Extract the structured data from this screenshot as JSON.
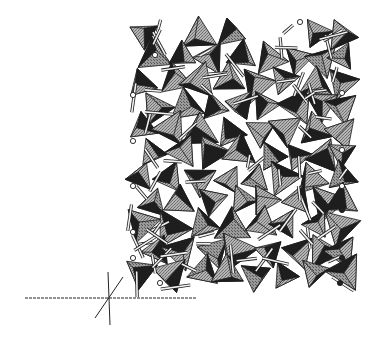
{
  "figure": {
    "type": "crystal-structure-polyhedral-model",
    "width": 376,
    "height": 341,
    "background": "#ffffff",
    "colors": {
      "face_light": "#a8a8a8",
      "face_mid": "#8a8a8a",
      "face_dark": "#1e1e1e",
      "edge": "#1a1a1a",
      "bond": "#f2f2f2",
      "atom": "#ffffff"
    },
    "structure_bounds": {
      "x": 130,
      "y": 18,
      "w": 220,
      "h": 270
    },
    "axes": {
      "horizontal": {
        "x1": 25,
        "y1": 298,
        "x2": 196,
        "y2": 298
      },
      "vertical": {
        "x1": 108,
        "y1": 272,
        "x2": 110,
        "y2": 325
      },
      "diagonal": {
        "x1": 95,
        "y1": 318,
        "x2": 123,
        "y2": 277
      }
    }
  }
}
